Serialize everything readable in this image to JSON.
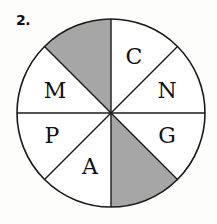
{
  "question": {
    "number": "2."
  },
  "wheel": {
    "center": [
      111,
      113
    ],
    "radius": 94,
    "stroke_color": "#1a1a1a",
    "shade_color": "#a6a6a6",
    "fill_color": "#ffffff",
    "segments": [
      {
        "position": "top-left",
        "label": "",
        "shaded": true
      },
      {
        "position": "top-right",
        "label": "C",
        "shaded": false
      },
      {
        "position": "right-upper",
        "label": "N",
        "shaded": false
      },
      {
        "position": "right-lower",
        "label": "G",
        "shaded": false
      },
      {
        "position": "bottom-right",
        "label": "",
        "shaded": true
      },
      {
        "position": "bottom-left",
        "label": "A",
        "shaded": false
      },
      {
        "position": "left-lower",
        "label": "P",
        "shaded": false
      },
      {
        "position": "left-upper",
        "label": "M",
        "shaded": false
      }
    ]
  }
}
